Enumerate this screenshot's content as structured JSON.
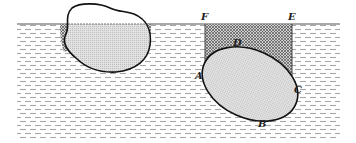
{
  "figure": {
    "labels": {
      "F": "F",
      "E": "E",
      "D": "D",
      "A": "A",
      "C": "C",
      "B": "B"
    },
    "colors": {
      "outline": "#111111",
      "liquid_dash": "#9a9a9a",
      "body_fill": "#d9d9d9",
      "crosshatch": "#555555"
    }
  }
}
